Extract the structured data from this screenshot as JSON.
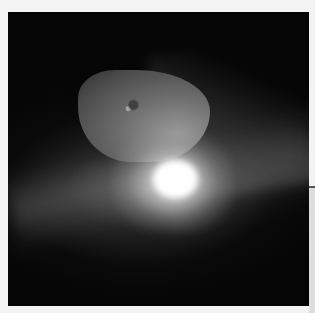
{
  "image": {
    "subject": "comet nucleus with bright impact flash and ejecta plume",
    "colors": {
      "background_space": "#050505",
      "page_margin": "#f3f3f3",
      "nucleus": "#6e6e6e",
      "flash": "#ffffff"
    }
  }
}
